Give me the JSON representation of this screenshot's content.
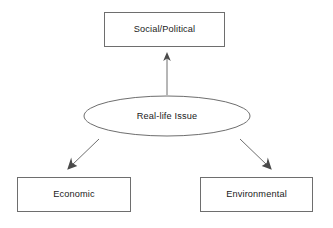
{
  "diagram": {
    "type": "concept-map",
    "background_color": "#ffffff",
    "stroke_color": "#6e6e6e",
    "text_color": "#1a1a1a",
    "arrow_color": "#4a4a4a",
    "nodes": [
      {
        "id": "social-political",
        "label": "Social/Political",
        "shape": "rectangle",
        "x": 104,
        "y": 12,
        "width": 121,
        "height": 35,
        "center_x": 164.5,
        "center_y": 29.5
      },
      {
        "id": "real-life-issue",
        "label": "Real-life Issue",
        "shape": "ellipse",
        "center_x": 167,
        "center_y": 116,
        "rx": 83,
        "ry": 20
      },
      {
        "id": "economic",
        "label": "Economic",
        "shape": "rectangle",
        "x": 17,
        "y": 177,
        "width": 114,
        "height": 35,
        "center_x": 74,
        "center_y": 194.5
      },
      {
        "id": "environmental",
        "label": "Environmental",
        "shape": "rectangle",
        "x": 200,
        "y": 177,
        "width": 113,
        "height": 35,
        "center_x": 256.5,
        "center_y": 194.5
      }
    ],
    "connectors": [
      {
        "id": "issue-to-social-political",
        "from": "real-life-issue",
        "to": "social-political",
        "direction": "up",
        "x1": 167,
        "y1": 95,
        "x2": 167,
        "y2": 54
      },
      {
        "id": "issue-to-economic",
        "from": "real-life-issue",
        "to": "economic",
        "direction": "down-left",
        "x1": 99,
        "y1": 139,
        "x2": 68,
        "y2": 169
      },
      {
        "id": "issue-to-environmental",
        "from": "real-life-issue",
        "to": "environmental",
        "direction": "down-right",
        "x1": 240,
        "y1": 139,
        "x2": 271,
        "y2": 169
      }
    ]
  }
}
